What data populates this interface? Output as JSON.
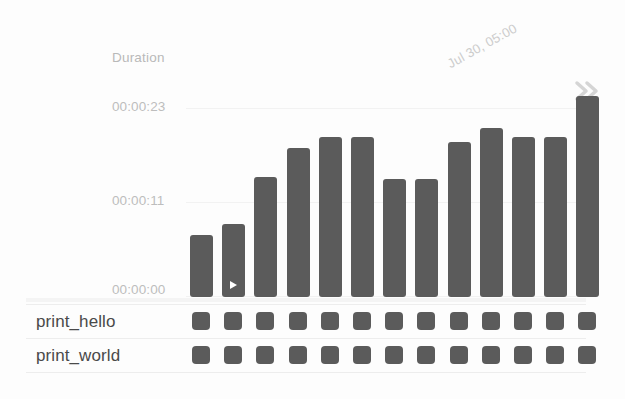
{
  "chart_data": {
    "type": "bar",
    "title": "",
    "ylabel": "Duration",
    "xlabel": "",
    "grid": true,
    "legend": "none",
    "ytick_labels": [
      "00:00:23",
      "00:00:11",
      "00:00:00"
    ],
    "ytick_values": [
      23,
      11,
      0
    ],
    "ylim": [
      0,
      24.5
    ],
    "x_axis_annotation": "Jul 30, 05:00",
    "categories": [
      "1",
      "2",
      "3",
      "4",
      "5",
      "6",
      "7",
      "8",
      "9",
      "10",
      "11",
      "12",
      "13"
    ],
    "values": [
      7.2,
      8.4,
      13.9,
      17.2,
      18.5,
      18.5,
      13.7,
      13.7,
      17.9,
      19.6,
      18.5,
      18.5,
      23.3
    ],
    "value_labels": [
      "00:00:07",
      "00:00:08",
      "00:00:14",
      "00:00:17",
      "00:00:19",
      "00:00:19",
      "00:00:14",
      "00:00:14",
      "00:00:18",
      "00:00:20",
      "00:00:19",
      "00:00:19",
      "00:00:23"
    ],
    "selected_index": 1,
    "selected_marker": "play-icon"
  },
  "axis": {
    "duration_label": "Duration",
    "ticks": [
      "00:00:23",
      "00:00:11",
      "00:00:00"
    ],
    "date": "Jul 30, 05:00"
  },
  "nav": {
    "next_icon": "double-chevron-right-icon"
  },
  "tasks": {
    "rows": [
      {
        "name": "print_hello",
        "runs": 13
      },
      {
        "name": "print_world",
        "runs": 13
      }
    ]
  },
  "colors": {
    "bar": "#5b5b5b",
    "tick_text": "#bdbdbd",
    "row_text": "#4a4a4a",
    "grid": "#f2f2f2",
    "background": "#fdfdfd"
  }
}
